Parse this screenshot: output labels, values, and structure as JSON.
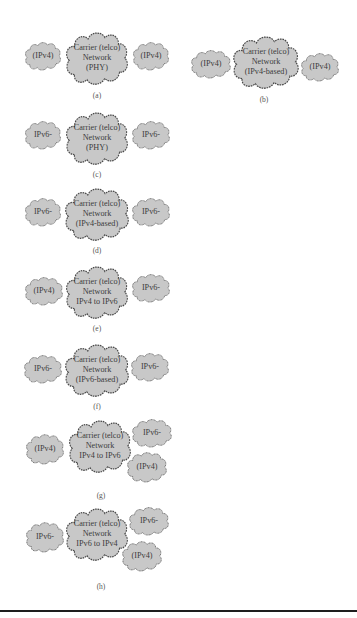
{
  "colors": {
    "cloud_fill": "#c8c8c8",
    "cloud_stroke": "#4a4a4a",
    "text": "#3c3c3c",
    "rule": "#1e1e1e"
  },
  "panels": [
    {
      "id": "a",
      "caption": "(a)",
      "left": "(IPv4)",
      "center": [
        "Carrier (telco)",
        "Network",
        "(PHY)"
      ],
      "right": "(IPv4)"
    },
    {
      "id": "b",
      "caption": "(b)",
      "left": "(IPv4)",
      "center": [
        "Carrier (telco)",
        "Network",
        "(IPv4-based)"
      ],
      "right": "(IPv4)"
    },
    {
      "id": "c",
      "caption": "(c)",
      "left": "IPv6-",
      "center": [
        "Carrier (telco)",
        "Network",
        "(PHY)"
      ],
      "right": "IPv6-"
    },
    {
      "id": "d",
      "caption": "(d)",
      "left": "IPv6-",
      "center": [
        "Carrier (telco)",
        "Network",
        "(IPv4-based)"
      ],
      "right": "IPv6-"
    },
    {
      "id": "e",
      "caption": "(e)",
      "left": "(IPv4)",
      "center": [
        "Carrier (telco)",
        "Network",
        "IPv4 to IPv6"
      ],
      "right": "IPv6-"
    },
    {
      "id": "f",
      "caption": "(f)",
      "left": "IPv6-",
      "center": [
        "Carrier (telco)",
        "Network",
        "(IPv6-based)"
      ],
      "right": "IPv6-"
    },
    {
      "id": "g",
      "caption": "(g)",
      "left": "(IPv4)",
      "center": [
        "Carrier (telco)",
        "Network",
        "IPv4 to IPv6"
      ],
      "right_top": "IPv6-",
      "right_bottom": "(IPv4)"
    },
    {
      "id": "h",
      "caption": "(h)",
      "left": "IPv6-",
      "center": [
        "Carrier (telco)",
        "Network",
        "IPv6 to IPv4"
      ],
      "right_top": "IPv6-",
      "right_bottom": "(IPv4)"
    }
  ]
}
